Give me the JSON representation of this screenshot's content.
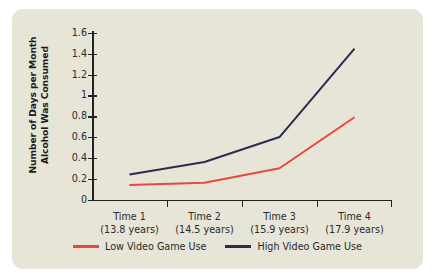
{
  "figure": {
    "background_color": "#e7e4d8",
    "page_background_color": "#ffffff",
    "axis_color": "#232323"
  },
  "axis_titles": {
    "y_line1": "Number of Days per Month",
    "y_line2": "Alcohol Was Consumed"
  },
  "legend": {
    "items": [
      {
        "label": "Low Video Game Use",
        "color": "#e8493a"
      },
      {
        "label": "High Video Game Use",
        "color": "#2b2c52"
      }
    ]
  },
  "chart_data": {
    "type": "line",
    "title": "",
    "xlabel": "",
    "ylabel": "Number of Days per Month Alcohol Was Consumed",
    "categories": [
      "Time 1",
      "Time 2",
      "Time 3",
      "Time 4"
    ],
    "category_sublabels": [
      "(13.8 years)",
      "(14.5 years)",
      "(15.9 years)",
      "(17.9 years)"
    ],
    "x": [
      1,
      2,
      3,
      4
    ],
    "series": [
      {
        "name": "Low Video Game Use",
        "color": "#e8493a",
        "values": [
          0.14,
          0.16,
          0.3,
          0.79
        ]
      },
      {
        "name": "High Video Game Use",
        "color": "#2b2c52",
        "values": [
          0.24,
          0.36,
          0.6,
          1.45
        ]
      }
    ],
    "ylim": [
      0,
      1.6
    ],
    "yticks": [
      0,
      0.2,
      0.4,
      0.6,
      0.8,
      1,
      1.2,
      1.4,
      1.6
    ],
    "ytick_labels": [
      "0",
      "0.2",
      "0.4",
      "0.6",
      "0.8",
      "1",
      "1.2",
      "1.4",
      "1.6"
    ],
    "grid": false,
    "legend_position": "bottom-center"
  }
}
